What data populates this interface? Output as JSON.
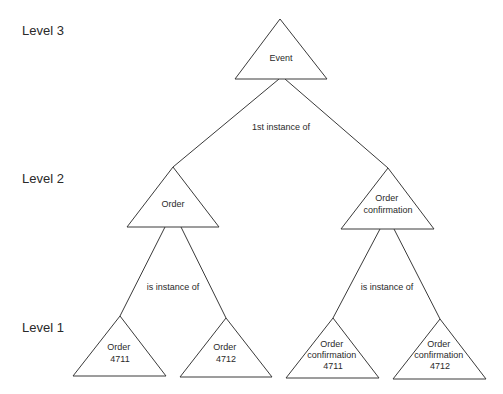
{
  "levels": [
    {
      "id": "level-3",
      "label": "Level 3"
    },
    {
      "id": "level-2",
      "label": "Level 2"
    },
    {
      "id": "level-1",
      "label": "Level 1"
    }
  ],
  "nodes": {
    "event": {
      "lines": [
        "Event"
      ]
    },
    "order": {
      "lines": [
        "Order"
      ]
    },
    "order_confirmation": {
      "lines": [
        "Order",
        "confirmation"
      ]
    },
    "order_4711": {
      "lines": [
        "Order",
        "4711"
      ]
    },
    "order_4712": {
      "lines": [
        "Order",
        "4712"
      ]
    },
    "order_confirmation_4711": {
      "lines": [
        "Order",
        "confirmation",
        "4711"
      ]
    },
    "order_confirmation_4712": {
      "lines": [
        "Order",
        "confirmation",
        "4712"
      ]
    }
  },
  "relations": {
    "level3_to_level2": "1st instance of",
    "order_to_instances": "is instance of",
    "confirmation_to_instances": "is instance of"
  },
  "edges": [
    {
      "from": "event",
      "to": "order"
    },
    {
      "from": "event",
      "to": "order_confirmation"
    },
    {
      "from": "order",
      "to": "order_4711"
    },
    {
      "from": "order",
      "to": "order_4712"
    },
    {
      "from": "order_confirmation",
      "to": "order_confirmation_4711"
    },
    {
      "from": "order_confirmation",
      "to": "order_confirmation_4712"
    }
  ]
}
